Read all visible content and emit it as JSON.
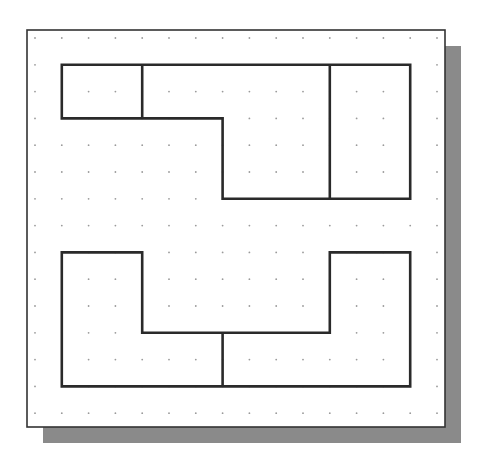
{
  "diagram": {
    "type": "grid-sketch",
    "colors": {
      "background": "#ffffff",
      "paper": "#ffffff",
      "frame": "#333333",
      "shadow": "#8a8a8a",
      "line": "#2a2a2a",
      "dot": "#9a9a9a"
    },
    "frame": {
      "x": 27,
      "y": 30,
      "width": 418,
      "height": 397
    },
    "shadow": {
      "offset_x": 16,
      "offset_y": 16
    },
    "grid": {
      "origin_x": 35,
      "origin_y": 38,
      "step": 26.8,
      "cols": 16,
      "rows": 15
    },
    "shapes": [
      {
        "name": "top-view-shape",
        "outline": [
          [
            1,
            1
          ],
          [
            14,
            1
          ],
          [
            14,
            6
          ],
          [
            7,
            6
          ],
          [
            7,
            3
          ],
          [
            1,
            3
          ]
        ],
        "inner_lines": [
          [
            [
              4,
              1
            ],
            [
              4,
              3
            ]
          ],
          [
            [
              11,
              1
            ],
            [
              11,
              6
            ]
          ]
        ]
      },
      {
        "name": "bottom-view-shape",
        "outline": [
          [
            1,
            8
          ],
          [
            4,
            8
          ],
          [
            4,
            11
          ],
          [
            11,
            11
          ],
          [
            11,
            8
          ],
          [
            14,
            8
          ],
          [
            14,
            13
          ],
          [
            1,
            13
          ]
        ],
        "inner_lines": [
          [
            [
              7,
              11
            ],
            [
              7,
              13
            ]
          ]
        ]
      }
    ]
  }
}
